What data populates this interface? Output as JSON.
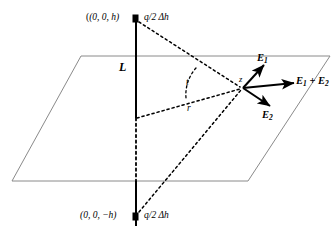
{
  "figure": {
    "background_color": "#ffffff",
    "plane_edge_color": "#808080",
    "line_color": "#000000",
    "vector_color": "#000000"
  },
  "labels": {
    "top_charge_position": "(0, 0, h)",
    "top_charge_value": "q/2 Δh",
    "bottom_charge_position": "(0, 0, −h)",
    "bottom_charge_value": "q/2 Δh",
    "line_label": "L",
    "field_point": "z",
    "angle": "t",
    "radius": "r",
    "vector_e1": "E",
    "vector_e1_sub": "1",
    "vector_e2": "E",
    "vector_e2_sub": "2",
    "vector_sum_first": "E",
    "vector_sum_first_sub": "1",
    "vector_sum_op": " + ",
    "vector_sum_second": "E",
    "vector_sum_second_sub": "2"
  },
  "geometry": {
    "plane_corners": [
      [
        81,
        56
      ],
      [
        330,
        56
      ],
      [
        248,
        181
      ],
      [
        12,
        181
      ]
    ],
    "vertical_line_x": 136,
    "vertical_line_top_y": 18,
    "vertical_line_bottom_y": 222,
    "top_charge_point": [
      136,
      18
    ],
    "bottom_charge_point": [
      136,
      216
    ],
    "plane_origin": [
      136,
      118
    ],
    "field_point": [
      243,
      88
    ],
    "e1_tip": [
      265,
      64
    ],
    "sum_tip": [
      296,
      83
    ],
    "e2_tip": [
      272,
      107
    ]
  }
}
